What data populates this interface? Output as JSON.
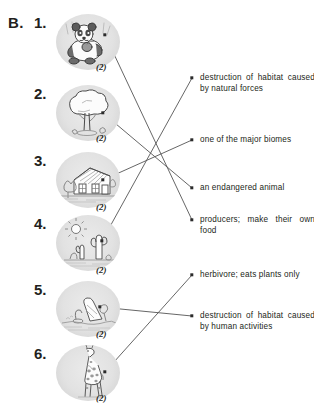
{
  "section": {
    "letter": "B."
  },
  "left_items": [
    {
      "number": "1.",
      "mark": "(2)",
      "icon": "panda-icon",
      "label": "panda eating bamboo"
    },
    {
      "number": "2.",
      "mark": "(2)",
      "icon": "tree-icon",
      "label": "broad tree"
    },
    {
      "number": "3.",
      "mark": "(2)",
      "icon": "house-icon",
      "label": "house and yard"
    },
    {
      "number": "4.",
      "mark": "(2)",
      "icon": "desert-icon",
      "label": "desert with sun and cactus"
    },
    {
      "number": "5.",
      "mark": "(2)",
      "icon": "logging-icon",
      "label": "cut tree stump logging"
    },
    {
      "number": "6.",
      "mark": "(2)",
      "icon": "giraffe-icon",
      "label": "giraffe"
    }
  ],
  "descriptions": [
    {
      "id": "a",
      "text": "destruction of habitat caused by natural forces"
    },
    {
      "id": "b",
      "text": "one of the major biomes"
    },
    {
      "id": "c",
      "text": "an endangered animal"
    },
    {
      "id": "d",
      "text": "producers; make their own food"
    },
    {
      "id": "e",
      "text": "herbivore; eats plants only"
    },
    {
      "id": "f",
      "text": "destruction of habitat caused by human activities"
    }
  ],
  "connections": [
    {
      "from": "1",
      "to": "d"
    },
    {
      "from": "2",
      "to": "c"
    },
    {
      "from": "3",
      "to": "b"
    },
    {
      "from": "4",
      "to": "a"
    },
    {
      "from": "5",
      "to": "f"
    },
    {
      "from": "6",
      "to": "e"
    }
  ],
  "colors": {
    "ink": "#231f20",
    "line": "#555555",
    "circle_bg": "#e3e3e3"
  }
}
